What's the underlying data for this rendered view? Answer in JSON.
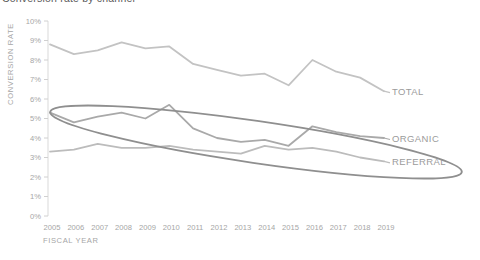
{
  "title": {
    "text": "Conversion rate by channel",
    "clipped": true
  },
  "colors": {
    "background": "#ffffff",
    "axis_line": "#d9d9d9",
    "tick_mark": "#d0d0d0",
    "axis_text": "#a6a6a6",
    "series_label_text": "#9b9b9b",
    "annotation": "#8f8f8f",
    "title_text": "#595959"
  },
  "chart_data": {
    "type": "line",
    "title": "Conversion rate by channel",
    "xlabel": "FISCAL YEAR",
    "ylabel": "CONVERSION RATE",
    "x": [
      2005,
      2006,
      2007,
      2008,
      2009,
      2010,
      2011,
      2012,
      2013,
      2014,
      2015,
      2016,
      2017,
      2018,
      2019
    ],
    "series": [
      {
        "name": "TOTAL",
        "color": "#c3c3c3",
        "values": [
          8.8,
          8.3,
          8.5,
          8.9,
          8.6,
          8.7,
          7.8,
          7.5,
          7.2,
          7.3,
          6.7,
          8.0,
          7.4,
          7.1,
          6.4
        ]
      },
      {
        "name": "ORGANIC",
        "color": "#a9a9a9",
        "values": [
          5.3,
          4.8,
          5.1,
          5.3,
          5.0,
          5.7,
          4.5,
          4.0,
          3.8,
          3.9,
          3.6,
          4.6,
          4.3,
          4.1,
          4.0
        ]
      },
      {
        "name": "REFERRAL",
        "color": "#bcbcbc",
        "values": [
          3.3,
          3.4,
          3.7,
          3.5,
          3.5,
          3.6,
          3.4,
          3.3,
          3.2,
          3.6,
          3.4,
          3.5,
          3.3,
          3.0,
          2.8
        ]
      }
    ],
    "ylim": [
      0,
      10
    ],
    "ytick_step": 1,
    "ytick_suffix": "%",
    "grid": false,
    "legend_position": "right-of-line-ends",
    "annotation": {
      "shape": "ellipse",
      "circled_series": [
        "ORGANIC",
        "REFERRAL"
      ],
      "center_px": [
        256,
        142
      ],
      "rx_px": 208,
      "ry_px": 21,
      "rotation_deg": 8.3,
      "color": "#8f8f8f",
      "stroke_width": 1.8
    }
  }
}
